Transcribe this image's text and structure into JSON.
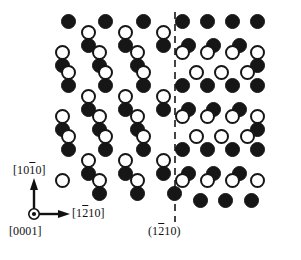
{
  "figure": {
    "width": 301,
    "height": 260,
    "background_color": "#ffffff"
  },
  "chart_data": {
    "type": "scatter",
    "xlabel": "[12̄10]",
    "ylabel": "[101̄0]",
    "grid": false,
    "legend_position": "none",
    "xlim": [
      0,
      301
    ],
    "ylim": [
      0,
      260
    ],
    "series": [
      {
        "name": "filled-atom",
        "marker": "filled-circle",
        "color": "#161616",
        "diameter": 15,
        "points": [
          [
            68,
            21
          ],
          [
            105,
            21
          ],
          [
            143,
            21
          ],
          [
            182,
            21
          ],
          [
            207,
            21
          ],
          [
            232,
            21
          ],
          [
            88,
            45
          ],
          [
            125,
            45
          ],
          [
            163,
            45
          ],
          [
            188,
            45
          ],
          [
            213,
            45
          ],
          [
            239,
            45
          ],
          [
            62,
            65
          ],
          [
            99,
            65
          ],
          [
            137,
            65
          ],
          [
            68,
            85
          ],
          [
            105,
            85
          ],
          [
            143,
            85
          ],
          [
            182,
            85
          ],
          [
            207,
            85
          ],
          [
            232,
            85
          ],
          [
            88,
            109
          ],
          [
            125,
            109
          ],
          [
            163,
            109
          ],
          [
            188,
            109
          ],
          [
            213,
            109
          ],
          [
            239,
            109
          ],
          [
            62,
            129
          ],
          [
            99,
            129
          ],
          [
            137,
            129
          ],
          [
            68,
            149
          ],
          [
            105,
            149
          ],
          [
            143,
            149
          ],
          [
            182,
            149
          ],
          [
            207,
            149
          ],
          [
            232,
            149
          ],
          [
            88,
            173
          ],
          [
            125,
            173
          ],
          [
            163,
            173
          ],
          [
            188,
            173
          ],
          [
            213,
            173
          ],
          [
            239,
            173
          ],
          [
            99,
            193
          ],
          [
            137,
            193
          ],
          [
            174,
            193
          ],
          [
            200,
            200
          ],
          [
            225,
            200
          ],
          [
            251,
            200
          ],
          [
            257,
            65
          ],
          [
            257,
            129
          ],
          [
            257,
            21
          ],
          [
            257,
            85
          ],
          [
            257,
            149
          ]
        ]
      },
      {
        "name": "open-atom",
        "marker": "open-circle",
        "color": "#ffffff",
        "edge_color": "#161616",
        "diameter": 15,
        "points": [
          [
            88,
            32
          ],
          [
            125,
            32
          ],
          [
            163,
            32
          ],
          [
            62,
            52
          ],
          [
            99,
            52
          ],
          [
            137,
            52
          ],
          [
            182,
            52
          ],
          [
            207,
            52
          ],
          [
            232,
            52
          ],
          [
            257,
            52
          ],
          [
            68,
            72
          ],
          [
            105,
            72
          ],
          [
            143,
            72
          ],
          [
            196,
            72
          ],
          [
            221,
            72
          ],
          [
            247,
            72
          ],
          [
            88,
            96
          ],
          [
            125,
            96
          ],
          [
            163,
            96
          ],
          [
            62,
            116
          ],
          [
            99,
            116
          ],
          [
            137,
            116
          ],
          [
            182,
            116
          ],
          [
            207,
            116
          ],
          [
            232,
            116
          ],
          [
            257,
            116
          ],
          [
            68,
            136
          ],
          [
            105,
            136
          ],
          [
            143,
            136
          ],
          [
            196,
            136
          ],
          [
            221,
            136
          ],
          [
            247,
            136
          ],
          [
            88,
            160
          ],
          [
            125,
            160
          ],
          [
            163,
            160
          ],
          [
            62,
            180
          ],
          [
            99,
            180
          ],
          [
            137,
            180
          ],
          [
            182,
            180
          ],
          [
            207,
            180
          ],
          [
            232,
            180
          ],
          [
            257,
            180
          ]
        ]
      }
    ],
    "annotations": [
      {
        "name": "boundary-line",
        "type": "vertical-dashed-line",
        "x": 175,
        "y_start": 12,
        "y_end": 222,
        "label": "(12̄10)"
      }
    ]
  },
  "axes": {
    "origin": {
      "x": 34,
      "y": 214
    },
    "vertical_axis": {
      "label_prefix": "[10",
      "label_overline": "1",
      "label_suffix": "0]",
      "direction": "up",
      "tip_y": 181
    },
    "horizontal_axis": {
      "label_prefix": "[1",
      "label_overline": "2",
      "label_suffix": "10]",
      "direction": "right",
      "tip_x": 68
    },
    "normal_axis": {
      "label": "[0001]",
      "symbol": "out-of-page-dot"
    }
  },
  "plane": {
    "label_prefix": "(1",
    "label_overline": "2",
    "label_suffix": "10)"
  }
}
